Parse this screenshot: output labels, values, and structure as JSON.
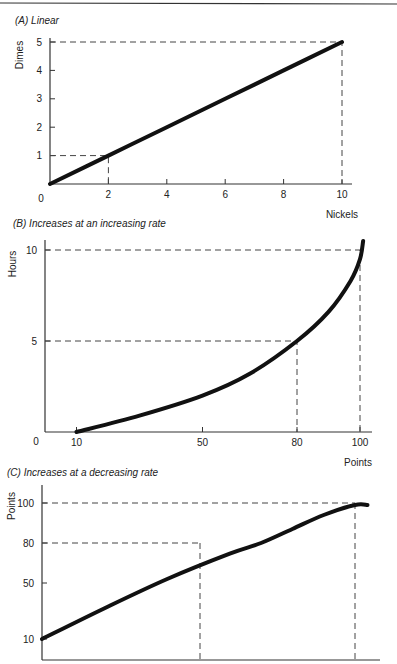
{
  "chart_data": [
    {
      "type": "line",
      "title": "(A) Linear",
      "xlabel": "Nickels",
      "ylabel": "Dimes",
      "xlim": [
        0,
        10
      ],
      "ylim": [
        0,
        5
      ],
      "x_ticks": [
        "2",
        "4",
        "6",
        "8",
        "10"
      ],
      "y_ticks": [
        "1",
        "2",
        "3",
        "4",
        "5"
      ],
      "origin_label": "0",
      "series": [
        {
          "name": "Linear",
          "x": [
            0,
            2,
            4,
            6,
            8,
            10
          ],
          "y": [
            0,
            1,
            2,
            3,
            4,
            5
          ]
        }
      ],
      "guides": [
        {
          "x": 2,
          "y": 1
        },
        {
          "x": 10,
          "y": 5
        }
      ]
    },
    {
      "type": "line",
      "title": "(B) Increases at an increasing rate",
      "xlabel": "Points",
      "ylabel": "Hours",
      "xlim": [
        0,
        100
      ],
      "ylim": [
        0,
        10
      ],
      "x_ticks": [
        "10",
        "50",
        "80",
        "100"
      ],
      "y_ticks": [
        "5",
        "10"
      ],
      "origin_label": "0",
      "series": [
        {
          "name": "Increasing rate",
          "x": [
            10,
            30,
            50,
            65,
            80,
            90,
            97,
            100,
            101
          ],
          "y": [
            0,
            0.9,
            2.0,
            3.2,
            5.0,
            6.6,
            8.3,
            9.5,
            10.5
          ]
        }
      ],
      "guides": [
        {
          "x": 80,
          "y": 5
        },
        {
          "x": 100,
          "y": 10
        }
      ]
    },
    {
      "type": "line",
      "title": "(C) Increases at a decreasing rate",
      "xlabel": "",
      "ylabel": "Points",
      "xlim": [
        0,
        100
      ],
      "ylim": [
        0,
        100
      ],
      "x_ticks": [],
      "y_ticks": [
        "10",
        "50",
        "80",
        "100"
      ],
      "series": [
        {
          "name": "Decreasing rate",
          "x": [
            0,
            20,
            40,
            60,
            70,
            80,
            90,
            100,
            104
          ],
          "y": [
            10,
            32,
            53,
            72,
            80,
            87,
            94,
            99,
            99
          ]
        }
      ],
      "guides": [
        {
          "y": 80
        },
        {
          "y": 100
        }
      ]
    }
  ]
}
